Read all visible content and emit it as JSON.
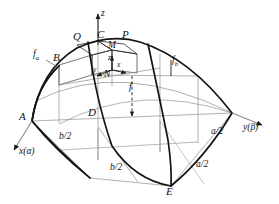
{
  "figure": {
    "kind": "shell-structure-axonometric-diagram",
    "stroke_color": "#1a1a1a",
    "thin_color": "#8a8a8a",
    "background": "#ffffff"
  },
  "axes": [
    {
      "id": "z",
      "label": "z",
      "name": "z-axis"
    },
    {
      "id": "x",
      "label": "x(α)",
      "name": "x-alpha-axis"
    },
    {
      "id": "y",
      "label": "y(β)",
      "name": "y-beta-axis"
    }
  ],
  "vertices": [
    {
      "id": "A",
      "label": "A"
    },
    {
      "id": "B",
      "label": "B"
    },
    {
      "id": "C",
      "label": "C"
    },
    {
      "id": "D",
      "label": "D"
    },
    {
      "id": "E",
      "label": "E"
    },
    {
      "id": "P",
      "label": "P"
    },
    {
      "id": "Q",
      "label": "Q"
    },
    {
      "id": "M",
      "label": "M"
    },
    {
      "id": "N",
      "label": "N"
    }
  ],
  "local_axes": [
    {
      "id": "local-x",
      "label": "x"
    },
    {
      "id": "local-y",
      "label": "y"
    },
    {
      "id": "local-z",
      "label": "z"
    }
  ],
  "rise_labels": [
    {
      "id": "f",
      "base": "f",
      "sub": "",
      "name": "rise-f"
    },
    {
      "id": "fa",
      "base": "f",
      "sub": "a",
      "name": "rise-f-a"
    },
    {
      "id": "fb",
      "base": "f",
      "sub": "b",
      "name": "rise-f-b"
    }
  ],
  "dimensions": [
    {
      "id": "b2-upper",
      "label": "b/2",
      "name": "dimension-b-half-upper"
    },
    {
      "id": "b2-lower",
      "label": "b/2",
      "name": "dimension-b-half-lower"
    },
    {
      "id": "a2-upper",
      "label": "a/2",
      "name": "dimension-a-half-upper"
    },
    {
      "id": "a2-lower",
      "label": "a/2",
      "name": "dimension-a-half-lower"
    }
  ]
}
